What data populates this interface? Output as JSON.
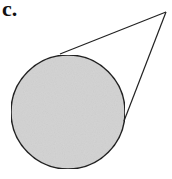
{
  "figure": {
    "label": "c.",
    "circle": {
      "cx": 68,
      "cy": 112,
      "r": 57,
      "fill": "#d4d4d4",
      "stroke": "#222222"
    },
    "apex": {
      "x": 166,
      "y": 12
    },
    "tangent_points": [
      {
        "x": 60,
        "y": 54
      },
      {
        "x": 124,
        "y": 121
      }
    ],
    "line_color": "#222222"
  }
}
